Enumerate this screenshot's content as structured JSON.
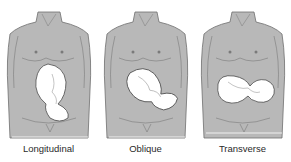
{
  "figure": {
    "panels": [
      {
        "label": "Longitudinal",
        "fetus_orientation": "vertical",
        "rotation": 0
      },
      {
        "label": "Oblique",
        "fetus_orientation": "diagonal",
        "rotation": -40
      },
      {
        "label": "Transverse",
        "fetus_orientation": "horizontal",
        "rotation": -90
      }
    ],
    "colors": {
      "torso_fill": "#b8b8b8",
      "outline": "#6e6e6e",
      "fetus_fill": "#ffffff",
      "background": "#ffffff"
    }
  }
}
